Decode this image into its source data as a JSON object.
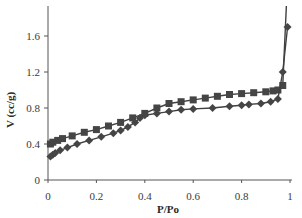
{
  "chart_data": {
    "type": "line",
    "title": "",
    "xlabel": "P/Po",
    "ylabel": "V (cc/g)",
    "xlim": [
      0,
      1
    ],
    "ylim": [
      0,
      1.9
    ],
    "x_ticks": [
      "0",
      "0.2",
      "0.4",
      "0.6",
      "0.8",
      "1"
    ],
    "y_ticks": [
      "0",
      "0.4",
      "0.8",
      "1.2",
      "1.6"
    ],
    "grid": false,
    "legend": "none",
    "series": [
      {
        "name": "Desorption (squares)",
        "marker": "square",
        "x": [
          0.01,
          0.02,
          0.04,
          0.06,
          0.1,
          0.15,
          0.2,
          0.25,
          0.3,
          0.35,
          0.4,
          0.45,
          0.5,
          0.55,
          0.6,
          0.65,
          0.7,
          0.75,
          0.8,
          0.85,
          0.9,
          0.93,
          0.95,
          0.97
        ],
        "y": [
          0.4,
          0.42,
          0.44,
          0.46,
          0.49,
          0.53,
          0.56,
          0.6,
          0.64,
          0.69,
          0.74,
          0.8,
          0.85,
          0.87,
          0.89,
          0.91,
          0.93,
          0.95,
          0.96,
          0.97,
          0.98,
          0.99,
          1.0,
          1.05
        ]
      },
      {
        "name": "Adsorption (diamonds)",
        "marker": "diamond",
        "x": [
          0.01,
          0.02,
          0.03,
          0.05,
          0.08,
          0.12,
          0.17,
          0.22,
          0.27,
          0.3,
          0.33,
          0.36,
          0.38,
          0.4,
          0.45,
          0.5,
          0.55,
          0.6,
          0.68,
          0.75,
          0.8,
          0.83,
          0.88,
          0.92,
          0.95,
          0.97,
          0.99
        ],
        "y": [
          0.26,
          0.28,
          0.3,
          0.33,
          0.36,
          0.4,
          0.44,
          0.48,
          0.52,
          0.55,
          0.59,
          0.64,
          0.69,
          0.72,
          0.74,
          0.76,
          0.78,
          0.79,
          0.8,
          0.82,
          0.83,
          0.84,
          0.85,
          0.87,
          0.9,
          1.2,
          1.7
        ]
      }
    ],
    "colors": {
      "line": "#404040",
      "marker": "#454545",
      "axis": "#555555"
    }
  }
}
